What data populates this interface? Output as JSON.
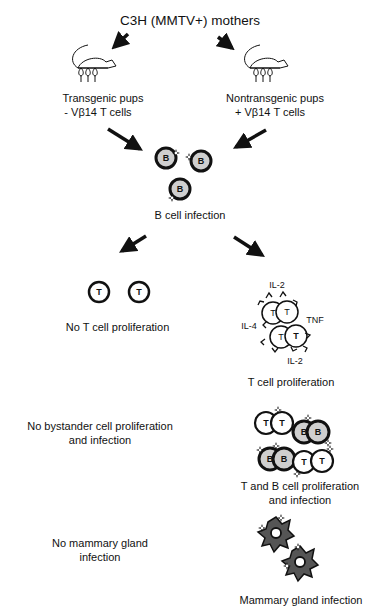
{
  "title": "C3H (MMTV+) mothers",
  "left_branch": {
    "pups_label": "Transgenic pups",
    "pups_sublabel": "- Vβ14 T cells",
    "t_cells_outcome": "No T cell proliferation",
    "bystander_outcome_line1": "No bystander cell proliferation",
    "bystander_outcome_line2": "and infection",
    "mammary_outcome_line1": "No mammary gland",
    "mammary_outcome_line2": "infection"
  },
  "right_branch": {
    "pups_label": "Nontransgenic pups",
    "pups_sublabel": "+ Vβ14 T cells",
    "t_cells_outcome": "T cell proliferation",
    "bystander_outcome_line1": "T and B cell proliferation",
    "bystander_outcome_line2": "and infection",
    "mammary_outcome": "Mammary gland infection"
  },
  "center": {
    "b_infection_label": "B cell infection"
  },
  "cell_labels": {
    "b": "B",
    "t": "T"
  },
  "cytokines": {
    "il2_top": "IL-2",
    "il4": "IL-4",
    "tnf": "TNF",
    "il2_bottom": "IL-2"
  },
  "colors": {
    "ink": "#111111",
    "b_cell_fill": "#cfcfcf",
    "gland_fill": "#555555"
  }
}
